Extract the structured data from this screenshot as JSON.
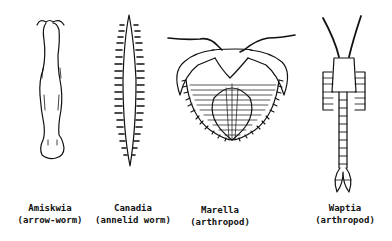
{
  "figure": {
    "specimens": [
      {
        "name": "Amiskwia",
        "group": "(arrow-worm)"
      },
      {
        "name": "Canadia",
        "group": "(annelid worm)"
      },
      {
        "name": "Marella",
        "group": "(arthropod)"
      },
      {
        "name": "Waptia",
        "group": "(arthropod)"
      }
    ],
    "colors": {
      "ink": "#111111",
      "background": "#ffffff"
    }
  }
}
